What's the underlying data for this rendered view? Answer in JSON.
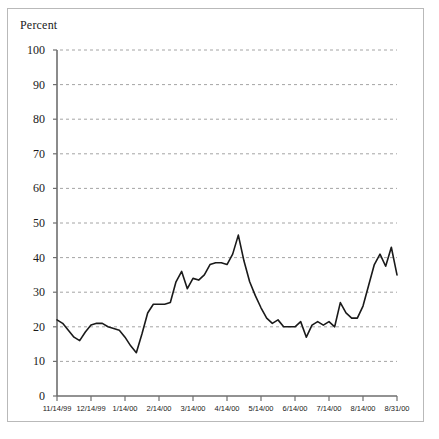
{
  "figure": {
    "border_color": "#b9b9b9",
    "background": "#ffffff"
  },
  "chart_data": {
    "type": "line",
    "title": "",
    "subtitle": "",
    "ylabel": "Percent",
    "xlabel": "",
    "ylim": [
      0,
      100
    ],
    "ytick_values": [
      0,
      10,
      20,
      30,
      40,
      50,
      60,
      70,
      80,
      90,
      100
    ],
    "ytick_labels": [
      "0",
      "10",
      "20",
      "30",
      "40",
      "50",
      "60",
      "70",
      "80",
      "90",
      "100"
    ],
    "xtick_labels": [
      "11/14/99",
      "12/14/99",
      "1/14/00",
      "2/14/00",
      "3/14/00",
      "4/14/00",
      "5/14/00",
      "6/14/00",
      "7/14/00",
      "8/14/00",
      "8/31/00"
    ],
    "grid": {
      "horizontal": true,
      "vertical": false,
      "style": "dashed",
      "color": "#9a9a9a"
    },
    "legend": {
      "visible": false,
      "position": "none"
    },
    "line": {
      "color": "#1a1a1a",
      "width": 1.6,
      "markers": false
    },
    "x": [
      0,
      1,
      2,
      3,
      4,
      5,
      6,
      7,
      8,
      9,
      10,
      11,
      12,
      13,
      14,
      15,
      16,
      17,
      18,
      19,
      20,
      21,
      22,
      23,
      24,
      25,
      26,
      27,
      28,
      29,
      30,
      31,
      32,
      33,
      34,
      35,
      36,
      37,
      38,
      39,
      40,
      41,
      42,
      43,
      44,
      45,
      46,
      47,
      48,
      49,
      50,
      51,
      52,
      53,
      54,
      55,
      56,
      57,
      58,
      59,
      60
    ],
    "values": [
      22.0,
      21.0,
      19.0,
      17.0,
      16.0,
      18.5,
      20.5,
      21.0,
      21.0,
      20.0,
      19.5,
      19.0,
      17.0,
      14.5,
      12.5,
      18.0,
      24.0,
      26.5,
      26.5,
      26.5,
      27.0,
      33.0,
      36.0,
      31.0,
      34.0,
      33.5,
      35.0,
      38.0,
      38.5,
      38.5,
      38.0,
      41.0,
      46.5,
      39.0,
      33.0,
      29.0,
      25.5,
      22.5,
      21.0,
      22.0,
      20.0,
      20.0,
      20.0,
      21.5,
      17.0,
      20.5,
      21.5,
      20.5,
      21.5,
      20.0,
      27.0,
      24.0,
      22.5,
      22.5,
      26.0,
      32.0,
      38.0,
      41.0,
      37.5,
      43.0,
      35.0
    ]
  }
}
